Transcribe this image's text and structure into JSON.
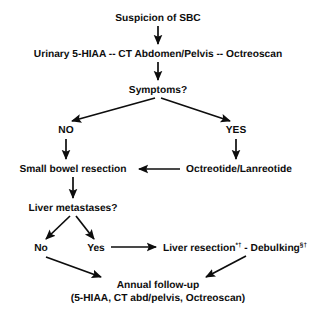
{
  "figure": {
    "type": "flowchart",
    "background_color": "#ffffff",
    "line_color": "#0d0d0d",
    "text_color": "#0d0d0d"
  },
  "nodes": {
    "suspicion": "Suspicion of SBC",
    "workup": "Urinary 5-HIAA -- CT Abdomen/Pelvis -- Octreoscan",
    "symptoms": "Symptoms?",
    "branch_no": "NO",
    "branch_yes": "YES",
    "resection": "Small bowel resection",
    "octreotide": "Octreotide/Lanreotide",
    "liver_mets": "Liver metastases?",
    "mets_no": "No",
    "mets_yes": "Yes",
    "liver_resection_label": "Liver resection",
    "liver_resection_sup": "*†",
    "dash_separator": " - ",
    "debulking_label": "Debulking",
    "debulking_sup": "§†",
    "followup_line1": "Annual follow-up",
    "followup_line2": "(5-HIAA, CT abd/pelvis, Octreoscan)"
  },
  "edges": [
    {
      "name": "suspicion-to-workup",
      "from": "suspicion",
      "to": "workup",
      "style": "arrow-down"
    },
    {
      "name": "workup-to-symptoms",
      "from": "workup",
      "to": "symptoms",
      "style": "arrow-down"
    },
    {
      "name": "symptoms-to-no",
      "from": "symptoms",
      "to": "branch_no",
      "style": "arrow-diagonal-left"
    },
    {
      "name": "symptoms-to-yes",
      "from": "symptoms",
      "to": "branch_yes",
      "style": "arrow-diagonal-right"
    },
    {
      "name": "no-to-resection",
      "from": "branch_no",
      "to": "resection",
      "style": "arrow-down"
    },
    {
      "name": "yes-to-octreotide",
      "from": "branch_yes",
      "to": "octreotide",
      "style": "arrow-down"
    },
    {
      "name": "octreotide-to-resection",
      "from": "octreotide",
      "to": "resection",
      "style": "arrow-left"
    },
    {
      "name": "resection-to-liver-mets",
      "from": "resection",
      "to": "liver_mets",
      "style": "arrow-down"
    },
    {
      "name": "liver-mets-to-no",
      "from": "liver_mets",
      "to": "mets_no",
      "style": "arrow-diagonal-left"
    },
    {
      "name": "liver-mets-to-yes",
      "from": "liver_mets",
      "to": "mets_yes",
      "style": "arrow-diagonal-right"
    },
    {
      "name": "yes-to-liver-resection",
      "from": "mets_yes",
      "to": "liver_resection_label",
      "style": "arrow-right"
    },
    {
      "name": "no-to-followup",
      "from": "mets_no",
      "to": "followup_line1",
      "style": "arrow-diagonal-right-down"
    },
    {
      "name": "liver-resection-to-followup",
      "from": "liver_resection_label",
      "to": "followup_line1",
      "style": "arrow-diagonal-left-down"
    }
  ]
}
